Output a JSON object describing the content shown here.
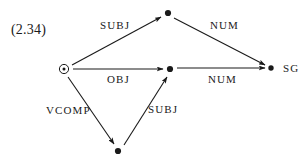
{
  "figure": {
    "equation_number": "(2.34)",
    "background_color": "#ffffff",
    "ink_color": "#1a1a1a",
    "width": 307,
    "height": 163
  },
  "nodes": [
    {
      "id": "root",
      "label": "",
      "kind": "circled-dot",
      "x": 64,
      "y": 69
    },
    {
      "id": "top",
      "label": "",
      "kind": "dot",
      "x": 168,
      "y": 13
    },
    {
      "id": "middle",
      "label": "",
      "kind": "dot",
      "x": 170,
      "y": 69
    },
    {
      "id": "sg",
      "label": "SG",
      "kind": "dot",
      "x": 271,
      "y": 68
    },
    {
      "id": "bottom",
      "label": "",
      "kind": "dot",
      "x": 118,
      "y": 151
    }
  ],
  "edges": [
    {
      "id": "e1",
      "label": "SUBJ",
      "from": "root",
      "to": "top",
      "x1": 72,
      "y1": 65,
      "x2": 161,
      "y2": 17
    },
    {
      "id": "e2",
      "label": "NUM",
      "from": "top",
      "to": "sg",
      "x1": 174,
      "y1": 18,
      "x2": 265,
      "y2": 65
    },
    {
      "id": "e3",
      "label": "OBJ",
      "from": "root",
      "to": "middle",
      "x1": 73,
      "y1": 69,
      "x2": 163,
      "y2": 69
    },
    {
      "id": "e4",
      "label": "NUM",
      "from": "middle",
      "to": "sg",
      "x1": 177,
      "y1": 68,
      "x2": 265,
      "y2": 68
    },
    {
      "id": "e5",
      "label": "VCOMP",
      "from": "root",
      "to": "bottom",
      "x1": 68,
      "y1": 77,
      "x2": 114,
      "y2": 144
    },
    {
      "id": "e6",
      "label": "SUBJ",
      "from": "bottom",
      "to": "middle",
      "x1": 124,
      "y1": 145,
      "x2": 167,
      "y2": 77
    }
  ],
  "labels": {
    "subj_top": "SUBJ",
    "num_top": "NUM",
    "obj": "OBJ",
    "num_bottom": "NUM",
    "vcomp": "VCOMP",
    "subj_bottom": "SUBJ",
    "sg": "SG"
  }
}
